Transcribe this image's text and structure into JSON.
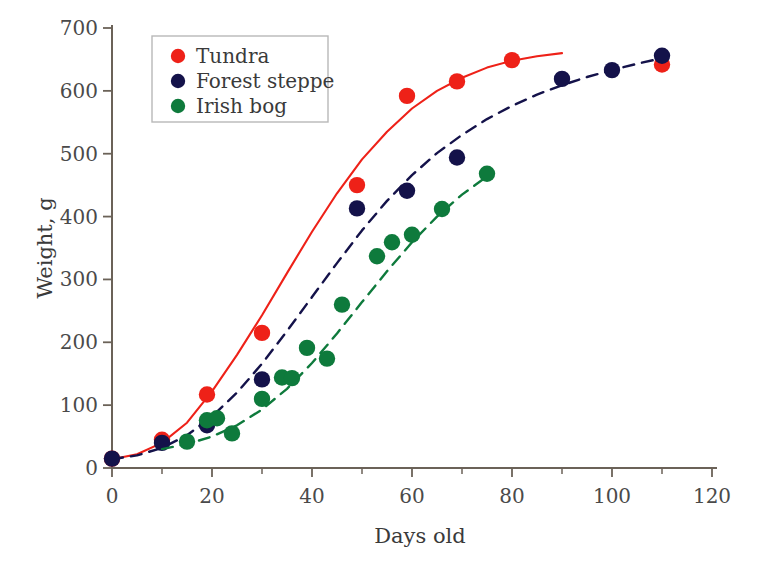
{
  "chart_data": {
    "type": "scatter",
    "title": "",
    "xlabel": "Days old",
    "ylabel": "Weight, g",
    "xlim": [
      0,
      120
    ],
    "ylim": [
      0,
      700
    ],
    "xticks": [
      0,
      20,
      40,
      60,
      80,
      100,
      120
    ],
    "yticks": [
      0,
      100,
      200,
      300,
      400,
      500,
      600,
      700
    ],
    "xminorticks": [
      10,
      30,
      50,
      70,
      90,
      110
    ],
    "grid": false,
    "legend_position": "upper-left",
    "series": [
      {
        "name": "Tundra",
        "color": "#ee2118",
        "marker": "circle",
        "line_style": "solid",
        "points": [
          {
            "x": 0,
            "y": 15
          },
          {
            "x": 10,
            "y": 45
          },
          {
            "x": 19,
            "y": 117
          },
          {
            "x": 30,
            "y": 215
          },
          {
            "x": 49,
            "y": 450
          },
          {
            "x": 59,
            "y": 592
          },
          {
            "x": 69,
            "y": 615
          },
          {
            "x": 80,
            "y": 649
          },
          {
            "x": 110,
            "y": 642
          }
        ],
        "fit_curve": [
          {
            "x": 0,
            "y": 14
          },
          {
            "x": 5,
            "y": 22
          },
          {
            "x": 10,
            "y": 40
          },
          {
            "x": 15,
            "y": 72
          },
          {
            "x": 20,
            "y": 122
          },
          {
            "x": 25,
            "y": 180
          },
          {
            "x": 30,
            "y": 243
          },
          {
            "x": 35,
            "y": 310
          },
          {
            "x": 40,
            "y": 376
          },
          {
            "x": 45,
            "y": 437
          },
          {
            "x": 50,
            "y": 491
          },
          {
            "x": 55,
            "y": 535
          },
          {
            "x": 60,
            "y": 572
          },
          {
            "x": 65,
            "y": 600
          },
          {
            "x": 70,
            "y": 621
          },
          {
            "x": 75,
            "y": 637
          },
          {
            "x": 80,
            "y": 648
          },
          {
            "x": 85,
            "y": 655
          },
          {
            "x": 90,
            "y": 660
          }
        ]
      },
      {
        "name": "Forest steppe",
        "color": "#14124a",
        "marker": "circle",
        "line_style": "dashed",
        "points": [
          {
            "x": 0,
            "y": 15
          },
          {
            "x": 10,
            "y": 40
          },
          {
            "x": 19,
            "y": 68
          },
          {
            "x": 30,
            "y": 141
          },
          {
            "x": 49,
            "y": 413
          },
          {
            "x": 59,
            "y": 441
          },
          {
            "x": 69,
            "y": 494
          },
          {
            "x": 90,
            "y": 619
          },
          {
            "x": 100,
            "y": 633
          },
          {
            "x": 110,
            "y": 656
          }
        ],
        "fit_curve": [
          {
            "x": 0,
            "y": 14
          },
          {
            "x": 5,
            "y": 20
          },
          {
            "x": 10,
            "y": 32
          },
          {
            "x": 15,
            "y": 52
          },
          {
            "x": 20,
            "y": 82
          },
          {
            "x": 25,
            "y": 120
          },
          {
            "x": 30,
            "y": 166
          },
          {
            "x": 35,
            "y": 218
          },
          {
            "x": 40,
            "y": 272
          },
          {
            "x": 45,
            "y": 326
          },
          {
            "x": 50,
            "y": 378
          },
          {
            "x": 55,
            "y": 425
          },
          {
            "x": 60,
            "y": 466
          },
          {
            "x": 65,
            "y": 501
          },
          {
            "x": 70,
            "y": 530
          },
          {
            "x": 75,
            "y": 555
          },
          {
            "x": 80,
            "y": 576
          },
          {
            "x": 85,
            "y": 594
          },
          {
            "x": 90,
            "y": 609
          },
          {
            "x": 95,
            "y": 622
          },
          {
            "x": 100,
            "y": 633
          },
          {
            "x": 105,
            "y": 643
          },
          {
            "x": 110,
            "y": 652
          }
        ]
      },
      {
        "name": "Irish bog",
        "color": "#0e7a3c",
        "marker": "circle",
        "line_style": "dashed",
        "points": [
          {
            "x": 15,
            "y": 42
          },
          {
            "x": 19,
            "y": 76
          },
          {
            "x": 21,
            "y": 79
          },
          {
            "x": 24,
            "y": 55
          },
          {
            "x": 30,
            "y": 110
          },
          {
            "x": 34,
            "y": 144
          },
          {
            "x": 36,
            "y": 143
          },
          {
            "x": 39,
            "y": 191
          },
          {
            "x": 43,
            "y": 174
          },
          {
            "x": 46,
            "y": 260
          },
          {
            "x": 53,
            "y": 337
          },
          {
            "x": 56,
            "y": 359
          },
          {
            "x": 60,
            "y": 371
          },
          {
            "x": 66,
            "y": 412
          },
          {
            "x": 75,
            "y": 468
          }
        ],
        "fit_curve": [
          {
            "x": 10,
            "y": 30
          },
          {
            "x": 15,
            "y": 38
          },
          {
            "x": 20,
            "y": 50
          },
          {
            "x": 25,
            "y": 68
          },
          {
            "x": 30,
            "y": 93
          },
          {
            "x": 35,
            "y": 126
          },
          {
            "x": 40,
            "y": 167
          },
          {
            "x": 45,
            "y": 214
          },
          {
            "x": 50,
            "y": 264
          },
          {
            "x": 55,
            "y": 313
          },
          {
            "x": 60,
            "y": 359
          },
          {
            "x": 65,
            "y": 400
          },
          {
            "x": 70,
            "y": 435
          },
          {
            "x": 75,
            "y": 464
          }
        ]
      }
    ]
  },
  "legend": {
    "items": [
      {
        "label": "Tundra",
        "color": "#ee2118"
      },
      {
        "label": "Forest steppe",
        "color": "#14124a"
      },
      {
        "label": "Irish bog",
        "color": "#0e7a3c"
      }
    ]
  }
}
